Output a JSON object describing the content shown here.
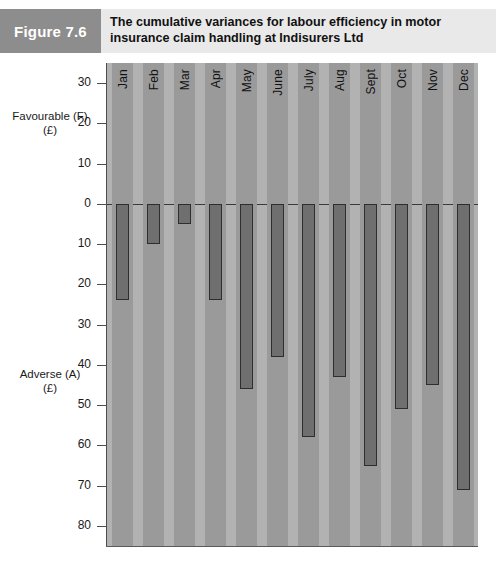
{
  "header": {
    "figure_tag": "Figure 7.6",
    "title_line1": "The cumulative variances for labour efficiency in motor",
    "title_line2": "insurance claim handling at Indisurers Ltd",
    "tag_bg": "#8d8d8d",
    "band_bg": "#e9e9e9"
  },
  "axis": {
    "favourable_caption_line1": "Favourable (F)",
    "favourable_caption_line2": "(£)",
    "adverse_caption_line1": "Adverse (A)",
    "adverse_caption_line2": "(£)",
    "tick_labels": [
      "30",
      "20",
      "10",
      "0",
      "10",
      "20",
      "30",
      "40",
      "50",
      "60",
      "70",
      "80"
    ]
  },
  "chart_data": {
    "type": "bar",
    "title": "The cumulative variances for labour efficiency in motor insurance claim handling at Indisurers Ltd",
    "xlabel": "",
    "ylabel": "Favourable (F) / Adverse (A) (£)",
    "categories": [
      "Jan",
      "Feb",
      "Mar",
      "Apr",
      "May",
      "June",
      "July",
      "Aug",
      "Sept",
      "Oct",
      "Nov",
      "Dec"
    ],
    "values": [
      -24,
      -10,
      -5,
      -24,
      -46,
      -38,
      -58,
      -43,
      -65,
      -51,
      -45,
      -71
    ],
    "ylim": [
      -85,
      35
    ],
    "yticks": [
      30,
      20,
      10,
      0,
      -10,
      -20,
      -30,
      -40,
      -50,
      -60,
      -70,
      -80
    ],
    "ytick_labels": [
      "30",
      "20",
      "10",
      "0",
      "10",
      "20",
      "30",
      "40",
      "50",
      "60",
      "70",
      "80"
    ],
    "grid": false,
    "legend": "none",
    "bar_fill": "#6f6f6f",
    "bar_stroke": "#2e2e2e",
    "plot_bg": "#b2b2b2",
    "band_bg": "#9a9a9a"
  }
}
